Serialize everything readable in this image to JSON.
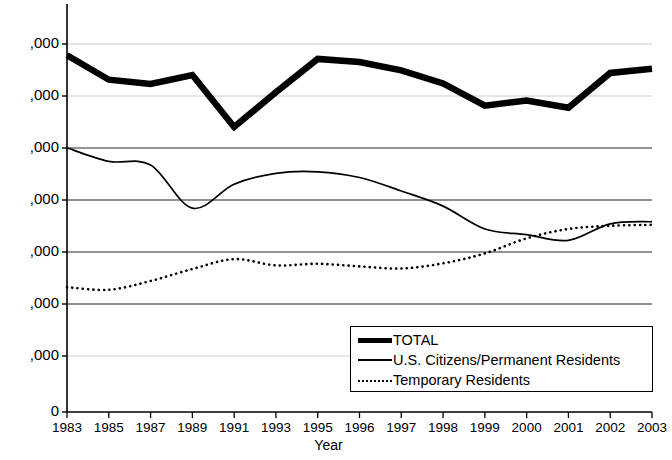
{
  "chart_data": {
    "type": "line",
    "title": "",
    "xlabel": "Year",
    "ylabel": "",
    "grid": true,
    "legend_position": "bottom-right",
    "note": "Y-axis tick labels are clipped at the left edge of the screenshot; only the trailing \",000\" of each label is visible.",
    "x": [
      "1983",
      "1985",
      "1987",
      "1989",
      "1991",
      "1993",
      "1995",
      "1996",
      "1997",
      "1998",
      "1999",
      "2000",
      "2001",
      "2002",
      "2003"
    ],
    "xticklabels": [
      "1983",
      "1985",
      "1987",
      "1989",
      "1991",
      "1993",
      "1995",
      "1996",
      "1997",
      "1998",
      "1999",
      "2000",
      "2001",
      "2002",
      "2003"
    ],
    "yticklabels": [
      ",000",
      ",000",
      ",000",
      ",000",
      ",000",
      ",000",
      ",000",
      "0"
    ],
    "ytick_pixel_y": [
      44,
      96,
      148,
      200,
      252,
      304,
      356,
      412
    ],
    "ylim": [
      0,
      7
    ],
    "series": [
      {
        "name": "TOTAL",
        "style": "thick-solid",
        "color": "#000000",
        "values": [
          6.86,
          6.39,
          6.31,
          6.48,
          5.48,
          6.15,
          6.79,
          6.73,
          6.57,
          6.32,
          5.89,
          5.99,
          5.85,
          6.52,
          6.6
        ]
      },
      {
        "name": "U.S. Citizens/Permanent Residents",
        "style": "thin-solid",
        "color": "#000000",
        "values": [
          5.08,
          4.82,
          4.75,
          3.92,
          4.38,
          4.59,
          4.62,
          4.51,
          4.25,
          3.96,
          3.52,
          3.41,
          3.3,
          3.62,
          3.66
        ]
      },
      {
        "name": "Temporary Residents",
        "style": "dotted",
        "color": "#000000",
        "values": [
          2.4,
          2.35,
          2.52,
          2.75,
          2.94,
          2.82,
          2.85,
          2.8,
          2.76,
          2.86,
          3.05,
          3.34,
          3.52,
          3.58,
          3.6
        ]
      }
    ]
  },
  "legend": {
    "items": [
      {
        "label": "TOTAL",
        "swatch": "thick-line-swatch"
      },
      {
        "label": "U.S. Citizens/Permanent Residents",
        "swatch": "thin-line-swatch"
      },
      {
        "label": "Temporary Residents",
        "swatch": "dotted-line-swatch"
      }
    ]
  },
  "axes": {
    "x_title": "Year"
  }
}
